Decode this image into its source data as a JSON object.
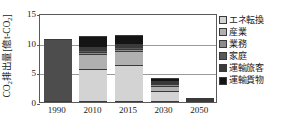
{
  "chart_data": {
    "type": "bar",
    "stacked": true,
    "title": "",
    "xlabel": "",
    "ylabel": "CO2排出量[億t-CO2]",
    "ylabel_parts": {
      "prefix": "CO",
      "sub1": "2",
      "middle": "排出量[億t-CO",
      "sub2": "2",
      "suffix": "]"
    },
    "categories": [
      "1990",
      "2010",
      "2015",
      "2030",
      "2050"
    ],
    "ylim": [
      0,
      15
    ],
    "yticks": [
      "0",
      "5",
      "10",
      "15"
    ],
    "ytick_values": [
      0,
      5,
      10,
      15
    ],
    "grid": true,
    "legend_position": "right",
    "series": [
      {
        "name": "エネ転換",
        "color": "#d3d3d3",
        "values": [
          null,
          5.6,
          6.3,
          1.8,
          0.2
        ]
      },
      {
        "name": "産業",
        "color": "#b0b0b0",
        "values": [
          null,
          2.5,
          2.3,
          0.9,
          0.1
        ]
      },
      {
        "name": "業務",
        "color": "#8c8c8c",
        "values": [
          null,
          0.3,
          0.3,
          0.3,
          0.05
        ]
      },
      {
        "name": "家庭",
        "color": "#595959",
        "values": [
          null,
          0.4,
          0.35,
          0.25,
          0.05
        ]
      },
      {
        "name": "運輸旅客",
        "color": "#3a3a3a",
        "values": [
          null,
          0.5,
          0.45,
          0.35,
          0.05
        ]
      },
      {
        "name": "運輸貨物",
        "color": "#141414",
        "values": [
          null,
          1.9,
          1.67,
          0.4,
          0.05
        ]
      }
    ],
    "bar_totals": [
      10.6,
      11.2,
      11.4,
      4.0,
      0.5
    ],
    "notes": {
      "1990": "single uniform dark-gray bar (no visible segmentation)",
      "1990_color": "#4d4d4d"
    }
  },
  "legend": {
    "items": [
      {
        "label": "エネ転換",
        "color": "#d3d3d3"
      },
      {
        "label": "産業",
        "color": "#b0b0b0"
      },
      {
        "label": "業務",
        "color": "#8c8c8c"
      },
      {
        "label": "家庭",
        "color": "#595959"
      },
      {
        "label": "運輸旅客",
        "color": "#3a3a3a"
      },
      {
        "label": "運輸貨物",
        "color": "#141414"
      }
    ]
  },
  "colors": {
    "axis": "#5a5a5a",
    "grid": "#9a9a9a",
    "background": "#ffffff",
    "text": "#1a1a1a"
  }
}
